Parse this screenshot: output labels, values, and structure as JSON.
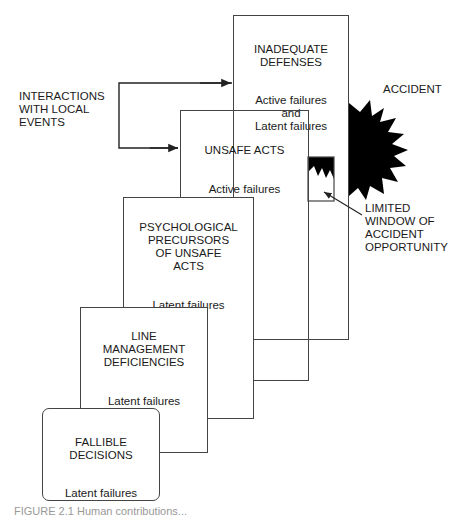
{
  "boxes": {
    "defenses": {
      "title": "INADEQUATE\nDEFENSES",
      "sub": "Active failures\nand\nLatent failures"
    },
    "unsafe_acts": {
      "title": "UNSAFE ACTS",
      "sub": "Active failures"
    },
    "psychological": {
      "title": "PSYCHOLOGICAL\nPRECURSORS\nOF UNSAFE\nACTS",
      "sub": "Latent failures"
    },
    "line_management": {
      "title": "LINE\nMANAGEMENT\nDEFICIENCIES",
      "sub": "Latent failures"
    },
    "fallible_decisions": {
      "title": "FALLIBLE\nDECISIONS",
      "sub": "Latent failures"
    }
  },
  "labels": {
    "interactions": "INTERACTIONS\nWITH LOCAL\nEVENTS",
    "accident": "ACCIDENT",
    "window": "LIMITED\nWINDOW OF\nACCIDENT\nOPPORTUNITY"
  },
  "caption": "FIGURE 2.1  Human contributions..."
}
